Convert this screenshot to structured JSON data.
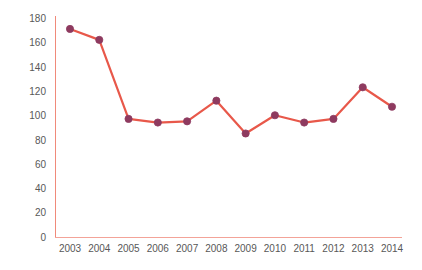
{
  "chart_data": {
    "type": "line",
    "title": "",
    "subtitle": "",
    "xlabel": "",
    "ylabel": "catch (t)",
    "categories": [
      "2003",
      "2004",
      "2005",
      "2006",
      "2007",
      "2008",
      "2009",
      "2010",
      "2011",
      "2012",
      "2013",
      "2014"
    ],
    "values": [
      171,
      162,
      97,
      94,
      95,
      112,
      85,
      100,
      94,
      97,
      123,
      107
    ],
    "series": [
      {
        "name": "catch",
        "values": [
          171,
          162,
          97,
          94,
          95,
          112,
          85,
          100,
          94,
          97,
          123,
          107
        ]
      }
    ],
    "ylim": [
      0,
      180
    ],
    "xlim_categories": [
      "2003",
      "2014"
    ],
    "yticks": [
      0,
      20,
      40,
      60,
      80,
      100,
      120,
      140,
      160,
      180
    ],
    "ytick_labels": [
      "0",
      "20",
      "40",
      "60",
      "80",
      "100",
      "120",
      "140",
      "160",
      "180"
    ],
    "xtick_labels": [
      "2003",
      "2004",
      "2005",
      "2006",
      "2007",
      "2008",
      "2009",
      "2010",
      "2011",
      "2012",
      "2013",
      "2014"
    ],
    "grid": false,
    "legend": false,
    "legend_position": "none",
    "annotations": [],
    "colors": {
      "line": "#E8584A",
      "marker_fill": "#8E3A5F",
      "marker_edge": "#8E3A5F",
      "axis": "#F08A7A",
      "axis_x": "#F3A398",
      "tick_text": "#585858",
      "background": "#FFFFFF"
    },
    "style": {
      "line_width": 2.2,
      "marker": "circle",
      "marker_size": 6
    }
  }
}
